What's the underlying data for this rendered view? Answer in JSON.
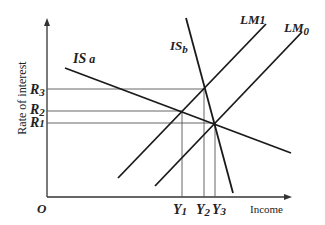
{
  "axes": {
    "y_label": "Rate of interest",
    "x_label": "Income",
    "origin": "O"
  },
  "curves": {
    "is_a": {
      "name": "IS",
      "sub": "a"
    },
    "is_b": {
      "name": "IS",
      "sub": "b"
    },
    "lm1": {
      "name": "LM",
      "sub": "1"
    },
    "lm0": {
      "name": "LM",
      "sub": "0"
    }
  },
  "rates": [
    {
      "name": "R",
      "sub": "3"
    },
    {
      "name": "R",
      "sub": "2"
    },
    {
      "name": "R",
      "sub": "1"
    }
  ],
  "incomes": [
    {
      "name": "Y",
      "sub": "1"
    },
    {
      "name": "Y",
      "sub": "2"
    },
    {
      "name": "Y",
      "sub": "3"
    }
  ]
}
